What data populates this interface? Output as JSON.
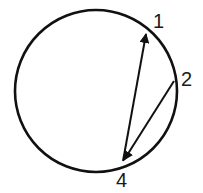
{
  "diagram": {
    "shape": "circle",
    "stroke_color": "#111111",
    "points": [
      {
        "id": "p1",
        "label": "1"
      },
      {
        "id": "p2",
        "label": "2"
      },
      {
        "id": "p4",
        "label": "4"
      }
    ],
    "edges": [
      {
        "from": "4",
        "to": "1",
        "arrow": "at-1"
      },
      {
        "from": "2",
        "to": "4",
        "arrow": "at-4"
      }
    ]
  }
}
